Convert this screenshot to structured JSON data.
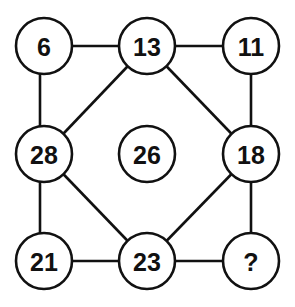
{
  "puzzle": {
    "type": "number-circle-grid",
    "nodes": {
      "top_left": "6",
      "top_center": "13",
      "top_right": "11",
      "middle_left": "28",
      "center": "26",
      "middle_right": "18",
      "bottom_left": "21",
      "bottom_center": "23",
      "bottom_right": "?"
    },
    "edges": [
      [
        "top_left",
        "top_center"
      ],
      [
        "top_center",
        "top_right"
      ],
      [
        "top_left",
        "middle_left"
      ],
      [
        "top_right",
        "middle_right"
      ],
      [
        "top_center",
        "middle_left"
      ],
      [
        "top_center",
        "middle_right"
      ],
      [
        "middle_left",
        "bottom_center"
      ],
      [
        "middle_right",
        "bottom_center"
      ],
      [
        "middle_left",
        "bottom_left"
      ],
      [
        "middle_right",
        "bottom_right"
      ],
      [
        "bottom_left",
        "bottom_center"
      ],
      [
        "bottom_center",
        "bottom_right"
      ]
    ],
    "colors": {
      "stroke": "#111111",
      "fill": "#ffffff",
      "text": "#111111"
    }
  }
}
